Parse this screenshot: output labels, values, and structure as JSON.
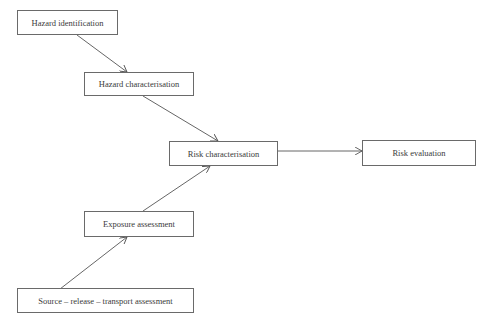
{
  "diagram": {
    "type": "flowchart",
    "nodes": [
      {
        "id": "hazard-identification",
        "label": "Hazard identification"
      },
      {
        "id": "hazard-characterisation",
        "label": "Hazard characterisation"
      },
      {
        "id": "risk-characterisation",
        "label": "Risk characterisation"
      },
      {
        "id": "risk-evaluation",
        "label": "Risk evaluation"
      },
      {
        "id": "exposure-assessment",
        "label": "Exposure assessment"
      },
      {
        "id": "source-release-transport",
        "label": "Source – release – transport assessment"
      }
    ],
    "edges": [
      {
        "from": "hazard-identification",
        "to": "hazard-characterisation"
      },
      {
        "from": "hazard-characterisation",
        "to": "risk-characterisation"
      },
      {
        "from": "exposure-assessment",
        "to": "risk-characterisation"
      },
      {
        "from": "source-release-transport",
        "to": "exposure-assessment"
      },
      {
        "from": "risk-characterisation",
        "to": "risk-evaluation"
      }
    ],
    "colors": {
      "border": "#6a6a6a",
      "arrow": "#555555",
      "text": "#3a3a3a",
      "background": "#ffffff"
    }
  }
}
